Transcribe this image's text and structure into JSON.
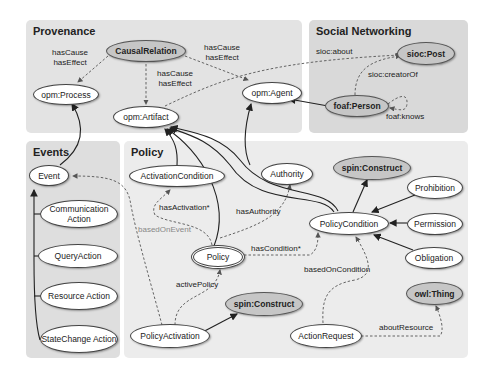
{
  "panels": {
    "provenance": {
      "title": "Provenance",
      "color": "#e3e3e3"
    },
    "social": {
      "title": "Social Networking",
      "color": "#d9d9d9"
    },
    "events": {
      "title": "Events",
      "color": "#dedede"
    },
    "policy": {
      "title": "Policy",
      "color": "#ececec"
    }
  },
  "nodes": {
    "causal_relation": "CausalRelation",
    "opm_process": "opm:Process",
    "opm_artifact": "opm:Artifact",
    "opm_agent": "opm:Agent",
    "sioc_post": "sioc:Post",
    "foaf_person": "foaf:Person",
    "event": "Event",
    "communication_action": "Communication Action",
    "query_action": "QueryAction",
    "resource_action": "Resource Action",
    "statechange_action": "StateChange Action",
    "activation_condition": "ActivationCondition",
    "authority": "Authority",
    "spin_construct_top": "spin:Construct",
    "prohibition": "Prohibition",
    "policy_condition": "PolicyCondition",
    "permission": "Permission",
    "obligation": "Obligation",
    "policy": "Policy",
    "owl_thing": "owl:Thing",
    "policy_activation": "PolicyActivation",
    "spin_construct_bottom": "spin:Construct",
    "action_request": "ActionRequest"
  },
  "edge_labels": {
    "cause_effect_process": "hasCause\nhasEffect",
    "cause_effect_artifact": "hasCause\nhasEffect",
    "cause_effect_agent": "hasCause\nhasEffect",
    "sioc_about": "sioc:about",
    "sioc_creator_of": "sioc:creatorOf",
    "foaf_knows": "foaf:knows",
    "has_activation": "hasActivation*",
    "based_on_event": "basedOnEvent",
    "has_authority": "hasAuthority",
    "has_condition": "hasCondition*",
    "active_policy": "activePolicy",
    "based_on_condition": "basedOnCondition",
    "about_resource": "aboutResource"
  }
}
